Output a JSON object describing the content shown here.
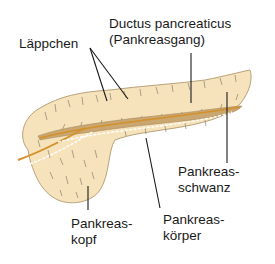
{
  "diagram": {
    "colors": {
      "tissue": "#f6e3bb",
      "tissue_outline": "#b8a27a",
      "lobule_lines": "#7f7766",
      "duct_fill": "#caa671",
      "duct_line": "#d4902a",
      "leader_lines": "#1a1a1a",
      "text": "#1a1a1a"
    },
    "labels": {
      "laeppchen": "Läppchen",
      "ductus_line1": "Ductus pancreaticus",
      "ductus_line2": "(Pankreasgang)",
      "schwanz_line1": "Pankreas-",
      "schwanz_line2": "schwanz",
      "koerper_line1": "Pankreas-",
      "koerper_line2": "körper",
      "kopf_line1": "Pankreas-",
      "kopf_line2": "kopf"
    }
  }
}
